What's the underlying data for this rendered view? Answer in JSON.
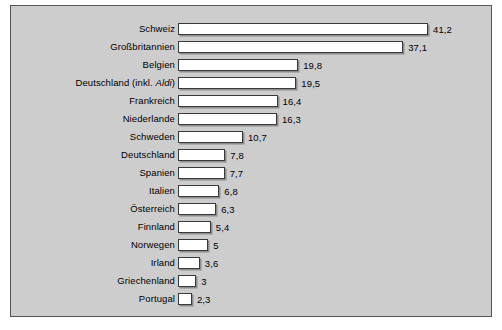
{
  "chart_data": {
    "type": "bar",
    "orientation": "horizontal",
    "title": "",
    "subtitle": "",
    "xlabel": "",
    "ylabel": "",
    "grid": false,
    "legend": null,
    "axis_visible": false,
    "xlim": [
      0,
      41.2
    ],
    "categories": [
      "Schweiz",
      "Großbritannien",
      "Belgien",
      "Deutschland (inkl. Aldi)",
      "Frankreich",
      "Niederlande",
      "Schweden",
      "Deutschland",
      "Spanien",
      "Italien",
      "Österreich",
      "Finnland",
      "Norwegen",
      "Irland",
      "Griechenland",
      "Portugal"
    ],
    "values": [
      41.2,
      37.1,
      19.8,
      19.5,
      16.4,
      16.3,
      10.7,
      7.8,
      7.7,
      6.8,
      6.3,
      5.4,
      5,
      3.6,
      3,
      2.3
    ],
    "value_labels": [
      "41,2",
      "37,1",
      "19,8",
      "19,5",
      "16,4",
      "16,3",
      "10,7",
      "7,8",
      "7,7",
      "6,8",
      "6,3",
      "5,4",
      "5",
      "3,6",
      "3",
      "2,3"
    ],
    "italic_segments": {
      "Deutschland (inkl. Aldi)": "Aldi"
    },
    "colors": {
      "background": "#cdcdcd",
      "page": "#ffffff",
      "bar_fill": "#ffffff",
      "bar_stroke": "#3a3a3a",
      "frame_border": "#555555",
      "text": "#000000",
      "bar_shadow": "#5a5a5a"
    }
  }
}
